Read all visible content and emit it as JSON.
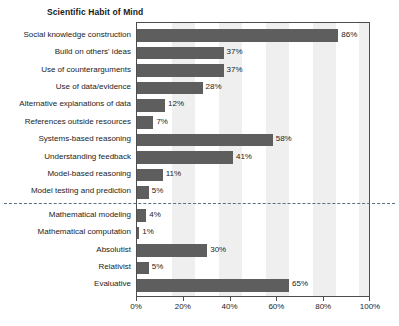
{
  "chart_data": {
    "type": "bar",
    "orientation": "horizontal",
    "title": "Scientific Habit of Mind",
    "xlabel": "",
    "ylabel": "",
    "xlim": [
      0,
      100
    ],
    "xticks": [
      0,
      20,
      40,
      60,
      80,
      100
    ],
    "xticklabels": [
      "0%",
      "20%",
      "40%",
      "60%",
      "80%",
      "100%"
    ],
    "grid": false,
    "banded_background": true,
    "legend": null,
    "value_label_suffix": "%",
    "bar_color": "#5e5e5e",
    "band_color": "#efefef",
    "divider_color": "#5f6b8a",
    "divider_after_index": 10,
    "categories": [
      "Social knowledge construction",
      "Build on others' ideas",
      "Use of counterarguments",
      "Use of data/evidence",
      "Alternative explanations of data",
      "References outside resources",
      "Systems-based reasoning",
      "Understanding feedback",
      "Model-based reasoning",
      "Model testing and prediction",
      "Mathematical modeling",
      "Mathematical computation",
      "Absolutist",
      "Relativist",
      "Evaluative"
    ],
    "values": [
      86,
      37,
      37,
      28,
      12,
      7,
      58,
      41,
      11,
      5,
      4,
      1,
      30,
      5,
      65
    ],
    "value_labels": [
      "86%",
      "37%",
      "37%",
      "28%",
      "12%",
      "7%",
      "58%",
      "41%",
      "11%",
      "5%",
      "4%",
      "1%",
      "30%",
      "5%",
      "65%"
    ],
    "groups": [
      {
        "name": "Scientific Habit of Mind",
        "categories": [
          "Social knowledge construction",
          "Build on others' ideas",
          "Use of counterarguments",
          "Use of data/evidence",
          "Alternative explanations of data",
          "References outside resources",
          "Systems-based reasoning",
          "Understanding feedback",
          "Model-based reasoning",
          "Model testing and prediction",
          "Mathematical modeling",
          "Mathematical computation"
        ]
      },
      {
        "name": "",
        "categories": [
          "Absolutist",
          "Relativist",
          "Evaluative"
        ]
      }
    ]
  }
}
